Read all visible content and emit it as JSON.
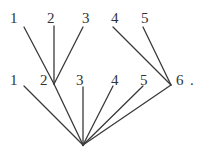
{
  "diagram": {
    "top_row": {
      "labels": [
        "1",
        "2",
        "3",
        "4",
        "5"
      ]
    },
    "middle_row": {
      "labels": [
        "1",
        "2",
        "3",
        "4",
        "5",
        "6"
      ],
      "trailing_mark": "."
    },
    "nodes": {
      "top": [
        {
          "label": "1",
          "x": 24,
          "y": 27
        },
        {
          "label": "2",
          "x": 54,
          "y": 26
        },
        {
          "label": "3",
          "x": 83,
          "y": 27
        },
        {
          "label": "4",
          "x": 113,
          "y": 27
        },
        {
          "label": "5",
          "x": 143,
          "y": 27
        }
      ],
      "junction_a": {
        "x": 54,
        "y": 84
      },
      "junction_b": {
        "x": 171,
        "y": 85
      },
      "middle": [
        {
          "label": "1",
          "x": 24,
          "y": 86
        },
        {
          "label": "2",
          "x": 54,
          "y": 84
        },
        {
          "label": "3",
          "x": 83,
          "y": 87
        },
        {
          "label": "4",
          "x": 113,
          "y": 86
        },
        {
          "label": "5",
          "x": 143,
          "y": 86
        },
        {
          "label": "6",
          "x": 171,
          "y": 85
        }
      ],
      "root": {
        "x": 83,
        "y": 145
      }
    },
    "edges": [
      {
        "from": "top-1",
        "to": "junction_a"
      },
      {
        "from": "top-2",
        "to": "junction_a"
      },
      {
        "from": "top-3",
        "to": "junction_a"
      },
      {
        "from": "top-4",
        "to": "junction_b"
      },
      {
        "from": "top-5",
        "to": "junction_b"
      },
      {
        "from": "middle-1",
        "to": "root"
      },
      {
        "from": "junction_a",
        "to": "root"
      },
      {
        "from": "middle-3",
        "to": "root"
      },
      {
        "from": "middle-4",
        "to": "root"
      },
      {
        "from": "middle-5",
        "to": "root"
      },
      {
        "from": "junction_b",
        "to": "root"
      }
    ],
    "colors": {
      "line": "#3a3a3a",
      "text": "#333333",
      "background": "#ffffff"
    }
  }
}
